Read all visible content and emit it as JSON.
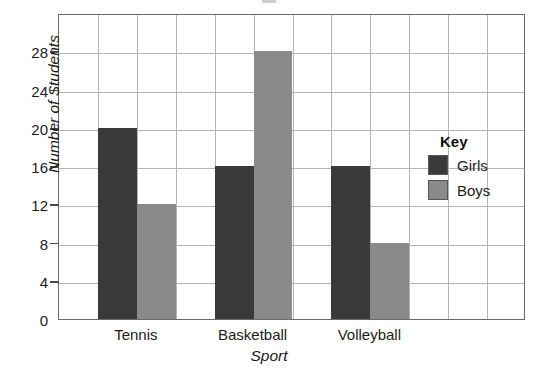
{
  "chart_data": {
    "type": "bar",
    "title": "",
    "xlabel": "Sport",
    "ylabel": "Number of Students",
    "categories": [
      "Tennis",
      "Basketball",
      "Volleyball"
    ],
    "series": [
      {
        "name": "Girls",
        "values": [
          20,
          16,
          16
        ],
        "color": "#3a3a3a"
      },
      {
        "name": "Boys",
        "values": [
          12,
          28,
          8
        ],
        "color": "#8a8a8a"
      }
    ],
    "ylim": [
      0,
      32
    ],
    "ytick_labels": [
      "0",
      "4",
      "8",
      "12",
      "16",
      "20",
      "24",
      "28"
    ],
    "ytick_values": [
      0,
      4,
      8,
      12,
      16,
      20,
      24,
      28
    ],
    "grid": true,
    "grid_columns": 12,
    "legend": {
      "title": "Key",
      "position": "inside-right",
      "entries": [
        {
          "label": "Girls",
          "color": "#3a3a3a"
        },
        {
          "label": "Boys",
          "color": "#8a8a8a"
        }
      ]
    }
  },
  "axes": {
    "y_title": "Number of Students",
    "x_title": "Sport",
    "y_ticks": [
      {
        "label": "0",
        "value": 0
      },
      {
        "label": "4",
        "value": 4
      },
      {
        "label": "8",
        "value": 8
      },
      {
        "label": "12",
        "value": 12
      },
      {
        "label": "16",
        "value": 16
      },
      {
        "label": "20",
        "value": 20
      },
      {
        "label": "24",
        "value": 24
      },
      {
        "label": "28",
        "value": 28
      }
    ],
    "x_ticks": [
      {
        "label": "Tennis"
      },
      {
        "label": "Basketball"
      },
      {
        "label": "Volleyball"
      }
    ]
  },
  "legend": {
    "title": "Key",
    "entries": [
      {
        "label": "Girls"
      },
      {
        "label": "Boys"
      }
    ]
  },
  "colors": {
    "girls": "#3a3a3a",
    "boys": "#8a8a8a",
    "gridline": "#b4b4b4",
    "frame": "#6b6b6b",
    "text": "#1b1b1b"
  }
}
